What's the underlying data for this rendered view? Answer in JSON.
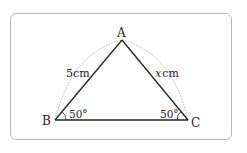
{
  "diagram": {
    "type": "isosceles-triangle",
    "vertices": {
      "A": {
        "label": "A",
        "x": 122,
        "y": 40
      },
      "B": {
        "label": "B",
        "x": 55,
        "y": 120
      },
      "C": {
        "label": "C",
        "x": 188,
        "y": 120
      }
    },
    "sides": {
      "AB": {
        "label": "5cm"
      },
      "AC": {
        "label_var": "x",
        "label_unit": "cm"
      }
    },
    "angles": {
      "B": {
        "label": "50°"
      },
      "C": {
        "label": "50°"
      }
    },
    "colors": {
      "line": "#222222",
      "arc": "#999999",
      "frame": "#b8b8b8"
    }
  }
}
